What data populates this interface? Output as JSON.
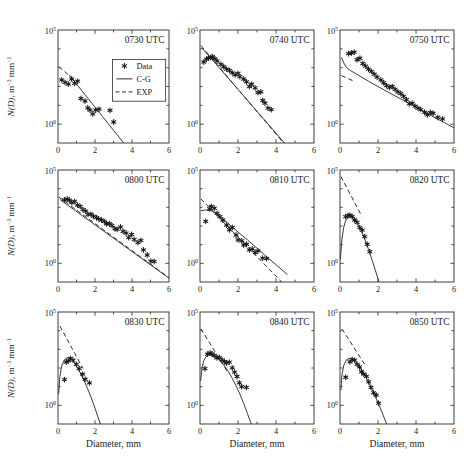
{
  "colors": {
    "background": "#ffffff",
    "frame": "#2b2b2b",
    "line": "#2e2e2e",
    "marker": "#1a1a1a",
    "text": "#1a1a1a"
  },
  "chart_data": {
    "type": "scatter",
    "grid": "off",
    "yscale": "log",
    "xlim": [
      0,
      6
    ],
    "ylim": [
      0.1,
      100000
    ],
    "xticks": [
      0,
      2,
      4,
      6
    ],
    "xticks_minor": [
      1,
      3,
      5
    ],
    "ytick_labels": [
      {
        "base": "10",
        "exp": "5",
        "value": 100000
      },
      {
        "base": "10",
        "exp": "0",
        "value": 1
      }
    ],
    "xlabel": "Diameter, mm",
    "ylabel": "N(D), m⁻³ mm⁻¹",
    "ylabel_parts": [
      {
        "t": "N(D)",
        "italic": true
      },
      {
        "t": ", m"
      },
      {
        "t": "−3",
        "sup": true
      },
      {
        "t": " mm"
      },
      {
        "t": "−1",
        "sup": true
      }
    ],
    "legend": {
      "panel_index": 0,
      "position": "center-right of first panel",
      "entries": [
        {
          "symbol": "star-marker",
          "label": "Data"
        },
        {
          "symbol": "solid-line",
          "label": "C-G"
        },
        {
          "symbol": "dashed-line",
          "label": "EXP"
        }
      ]
    },
    "panels": [
      {
        "title": "0730 UTC",
        "data": [
          [
            0.2,
            224
          ],
          [
            0.38,
            166
          ],
          [
            0.56,
            135
          ],
          [
            0.74,
            251
          ],
          [
            0.9,
            148
          ],
          [
            1.06,
            191
          ],
          [
            1.24,
            23
          ],
          [
            1.46,
            17
          ],
          [
            1.61,
            7.4
          ],
          [
            1.73,
            5.6
          ],
          [
            1.88,
            3.5
          ],
          [
            2.04,
            5.6
          ],
          [
            2.22,
            6.3
          ],
          [
            2.81,
            5.4
          ],
          [
            3.01,
            1.3
          ]
        ],
        "cg": [
          [
            0.6,
            417
          ],
          [
            1.2,
            76
          ],
          [
            1.8,
            14
          ],
          [
            2.4,
            2.6
          ],
          [
            3.0,
            0.47
          ],
          [
            3.55,
            0.1
          ]
        ],
        "exp": [
          [
            0.05,
            1120
          ],
          [
            0.65,
            355
          ]
        ]
      },
      {
        "title": "0740 UTC",
        "data": [
          [
            0.2,
            2000
          ],
          [
            0.35,
            2820
          ],
          [
            0.45,
            3310
          ],
          [
            0.55,
            3550
          ],
          [
            0.65,
            3800
          ],
          [
            0.78,
            3020
          ],
          [
            0.9,
            2240
          ],
          [
            1.1,
            1510
          ],
          [
            1.25,
            1120
          ],
          [
            1.4,
            830
          ],
          [
            1.55,
            710
          ],
          [
            1.7,
            525
          ],
          [
            1.85,
            417
          ],
          [
            2.0,
            500
          ],
          [
            2.1,
            331
          ],
          [
            2.3,
            251
          ],
          [
            2.45,
            178
          ],
          [
            2.6,
            100
          ],
          [
            2.72,
            132
          ],
          [
            2.9,
            85
          ],
          [
            3.05,
            48
          ],
          [
            3.2,
            52
          ],
          [
            3.3,
            18
          ],
          [
            3.42,
            13
          ],
          [
            3.58,
            7.1
          ],
          [
            3.75,
            5.9
          ]
        ],
        "cg": [
          [
            0.1,
            11200
          ],
          [
            1.0,
            1020
          ],
          [
            2.0,
            70
          ],
          [
            3.0,
            4.8
          ],
          [
            4.0,
            0.33
          ],
          [
            4.45,
            0.1
          ]
        ],
        "exp": [
          [
            0.05,
            15100
          ],
          [
            4.4,
            0.1
          ]
        ]
      },
      {
        "title": "0750 UTC",
        "data": [
          [
            0.45,
            5620
          ],
          [
            0.6,
            6030
          ],
          [
            0.75,
            6610
          ],
          [
            0.9,
            2630
          ],
          [
            1.05,
            3160
          ],
          [
            1.2,
            1660
          ],
          [
            1.35,
            1200
          ],
          [
            1.5,
            830
          ],
          [
            1.65,
            630
          ],
          [
            1.8,
            450
          ],
          [
            1.95,
            316
          ],
          [
            2.15,
            224
          ],
          [
            2.3,
            158
          ],
          [
            2.45,
            112
          ],
          [
            2.6,
            89
          ],
          [
            2.75,
            100
          ],
          [
            2.9,
            71
          ],
          [
            3.05,
            52
          ],
          [
            3.2,
            42
          ],
          [
            3.35,
            30
          ],
          [
            3.5,
            20
          ],
          [
            3.65,
            12
          ],
          [
            3.8,
            13
          ],
          [
            3.95,
            9
          ],
          [
            4.1,
            7.1
          ],
          [
            4.25,
            5.9
          ],
          [
            4.45,
            4.3
          ],
          [
            4.6,
            3.1
          ],
          [
            4.75,
            4.2
          ],
          [
            4.9,
            3.8
          ],
          [
            5.15,
            2.3
          ],
          [
            5.4,
            1.9
          ]
        ],
        "cg": [
          [
            0.08,
            3550
          ],
          [
            0.2,
            1780
          ],
          [
            0.35,
            1000
          ],
          [
            0.55,
            710
          ],
          [
            0.8,
            500
          ],
          [
            1.1,
            331
          ],
          [
            1.5,
            190
          ],
          [
            2.0,
            100
          ],
          [
            2.5,
            52
          ],
          [
            3.0,
            28
          ],
          [
            3.5,
            15
          ],
          [
            4.0,
            7.9
          ],
          [
            4.5,
            4.2
          ],
          [
            5.0,
            2.2
          ],
          [
            5.5,
            1.2
          ],
          [
            6.0,
            0.63
          ]
        ],
        "exp": [
          [
            0.08,
            380
          ],
          [
            0.75,
            186
          ]
        ]
      },
      {
        "title": "0800 UTC",
        "data": [
          [
            0.35,
            2510
          ],
          [
            0.5,
            2820
          ],
          [
            0.62,
            2400
          ],
          [
            0.75,
            1780
          ],
          [
            0.9,
            2090
          ],
          [
            1.05,
            1320
          ],
          [
            1.2,
            1120
          ],
          [
            1.35,
            760
          ],
          [
            1.5,
            631
          ],
          [
            1.62,
            417
          ],
          [
            1.78,
            427
          ],
          [
            1.92,
            331
          ],
          [
            2.08,
            282
          ],
          [
            2.2,
            240
          ],
          [
            2.35,
            209
          ],
          [
            2.5,
            178
          ],
          [
            2.62,
            132
          ],
          [
            2.78,
            132
          ],
          [
            2.92,
            105
          ],
          [
            3.08,
            71
          ],
          [
            3.2,
            66
          ],
          [
            3.38,
            89
          ],
          [
            3.52,
            52
          ],
          [
            3.68,
            42
          ],
          [
            3.82,
            24
          ],
          [
            3.98,
            35
          ],
          [
            4.12,
            19
          ],
          [
            4.32,
            13
          ],
          [
            4.48,
            17
          ],
          [
            4.62,
            5.2
          ],
          [
            4.82,
            2.8
          ],
          [
            5.02,
            1.3
          ],
          [
            5.2,
            1.26
          ]
        ],
        "cg": [
          [
            0.1,
            2630
          ],
          [
            6.0,
            0.16
          ]
        ],
        "exp": [
          [
            0.05,
            3550
          ],
          [
            6.0,
            0.17
          ]
        ]
      },
      {
        "title": "0810 UTC",
        "data": [
          [
            0.3,
            178
          ],
          [
            0.5,
            830
          ],
          [
            0.6,
            1120
          ],
          [
            0.75,
            890
          ],
          [
            0.9,
            480
          ],
          [
            1.05,
            316
          ],
          [
            1.2,
            209
          ],
          [
            1.4,
            112
          ],
          [
            1.55,
            63
          ],
          [
            1.7,
            83
          ],
          [
            1.9,
            33
          ],
          [
            2.0,
            18
          ],
          [
            2.2,
            16
          ],
          [
            2.3,
            9.5
          ],
          [
            2.45,
            10.5
          ],
          [
            2.6,
            5.2
          ],
          [
            2.75,
            6.0
          ],
          [
            2.9,
            3.8
          ],
          [
            3.05,
            4.6
          ],
          [
            3.3,
            1.9
          ],
          [
            3.5,
            1.8
          ]
        ],
        "cg": [
          [
            0.05,
            660
          ],
          [
            0.3,
            724
          ],
          [
            0.6,
            660
          ],
          [
            1.0,
            355
          ],
          [
            1.5,
            132
          ],
          [
            2.0,
            48
          ],
          [
            2.5,
            18
          ],
          [
            3.0,
            6.5
          ],
          [
            3.5,
            2.3
          ],
          [
            4.0,
            0.85
          ],
          [
            4.6,
            0.25
          ]
        ],
        "exp": [
          [
            0.05,
            2820
          ],
          [
            4.3,
            0.1
          ]
        ]
      },
      {
        "title": "0820 UTC",
        "data": [
          [
            0.3,
            316
          ],
          [
            0.42,
            363
          ],
          [
            0.52,
            380
          ],
          [
            0.64,
            316
          ],
          [
            0.77,
            209
          ],
          [
            0.9,
            158
          ],
          [
            1.04,
            81
          ],
          [
            1.17,
            60
          ],
          [
            1.3,
            27
          ],
          [
            1.43,
            10.5
          ],
          [
            1.57,
            4.2
          ]
        ],
        "cg": [
          [
            0.02,
            1.6
          ],
          [
            0.1,
            20
          ],
          [
            0.2,
            89
          ],
          [
            0.3,
            200
          ],
          [
            0.45,
            316
          ],
          [
            0.6,
            355
          ],
          [
            0.75,
            282
          ],
          [
            0.9,
            158
          ],
          [
            1.1,
            63
          ],
          [
            1.3,
            20
          ],
          [
            1.5,
            5.6
          ],
          [
            1.7,
            1.4
          ],
          [
            1.9,
            0.32
          ],
          [
            2.05,
            0.1
          ]
        ],
        "exp": [
          [
            0.05,
            44700
          ],
          [
            1.15,
            324
          ]
        ]
      },
      {
        "title": "0830 UTC",
        "data": [
          [
            0.35,
            24
          ],
          [
            0.45,
            209
          ],
          [
            0.55,
            240
          ],
          [
            0.67,
            324
          ],
          [
            0.81,
            263
          ],
          [
            0.99,
            158
          ],
          [
            1.15,
            93
          ],
          [
            1.33,
            47
          ],
          [
            1.47,
            25
          ],
          [
            1.7,
            16
          ]
        ],
        "cg": [
          [
            0.03,
            4
          ],
          [
            0.1,
            35
          ],
          [
            0.2,
            126
          ],
          [
            0.35,
            282
          ],
          [
            0.5,
            363
          ],
          [
            0.65,
            331
          ],
          [
            0.8,
            240
          ],
          [
            1.0,
            126
          ],
          [
            1.2,
            56
          ],
          [
            1.4,
            22
          ],
          [
            1.6,
            7.9
          ],
          [
            1.8,
            2.5
          ],
          [
            2.0,
            0.7
          ],
          [
            2.2,
            0.18
          ],
          [
            2.3,
            0.1
          ]
        ],
        "exp": [
          [
            0.1,
            17800
          ],
          [
            1.35,
            93
          ]
        ]
      },
      {
        "title": "0840 UTC",
        "data": [
          [
            0.26,
            93
          ],
          [
            0.39,
            550
          ],
          [
            0.53,
            646
          ],
          [
            0.63,
            575
          ],
          [
            0.75,
            468
          ],
          [
            0.89,
            347
          ],
          [
            1.02,
            363
          ],
          [
            1.16,
            275
          ],
          [
            1.28,
            224
          ],
          [
            1.4,
            182
          ],
          [
            1.54,
            204
          ],
          [
            1.7,
            102
          ],
          [
            1.82,
            60
          ],
          [
            1.95,
            35
          ],
          [
            2.07,
            16
          ],
          [
            2.19,
            10
          ],
          [
            2.44,
            9.1
          ]
        ],
        "cg": [
          [
            0.03,
            20
          ],
          [
            0.1,
            89
          ],
          [
            0.2,
            251
          ],
          [
            0.35,
            447
          ],
          [
            0.5,
            525
          ],
          [
            0.7,
            480
          ],
          [
            0.9,
            355
          ],
          [
            1.1,
            224
          ],
          [
            1.3,
            126
          ],
          [
            1.5,
            63
          ],
          [
            1.7,
            28
          ],
          [
            1.9,
            11
          ],
          [
            2.1,
            4
          ],
          [
            2.3,
            1.26
          ],
          [
            2.5,
            0.35
          ],
          [
            2.7,
            0.1
          ]
        ],
        "exp": [
          [
            0.05,
            12600
          ],
          [
            1.5,
            50
          ]
        ]
      },
      {
        "title": "0850 UTC",
        "data": [
          [
            0.3,
            32
          ],
          [
            0.52,
            214
          ],
          [
            0.64,
            282
          ],
          [
            0.77,
            263
          ],
          [
            0.9,
            158
          ],
          [
            1.03,
            115
          ],
          [
            1.13,
            63
          ],
          [
            1.25,
            47
          ],
          [
            1.39,
            36
          ],
          [
            1.51,
            18
          ],
          [
            1.63,
            9.1
          ],
          [
            1.77,
            4.7
          ],
          [
            1.91,
            3.5
          ],
          [
            2.03,
            1.3
          ]
        ],
        "cg": [
          [
            0.04,
            6.3
          ],
          [
            0.1,
            40
          ],
          [
            0.2,
            141
          ],
          [
            0.35,
            282
          ],
          [
            0.5,
            331
          ],
          [
            0.65,
            302
          ],
          [
            0.8,
            224
          ],
          [
            1.0,
            126
          ],
          [
            1.2,
            63
          ],
          [
            1.4,
            28
          ],
          [
            1.6,
            11
          ],
          [
            1.8,
            4
          ],
          [
            2.0,
            1.4
          ],
          [
            2.2,
            0.45
          ],
          [
            2.45,
            0.1
          ]
        ],
        "exp": [
          [
            0.1,
            12600
          ],
          [
            1.3,
            158
          ]
        ]
      }
    ]
  }
}
